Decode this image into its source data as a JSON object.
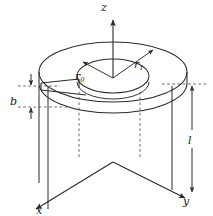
{
  "figure": {
    "background_color": "#ffffff",
    "line_color": "#2b2b2b",
    "dashed_color": "#555555",
    "label_color": "#1a1a1a"
  },
  "axes": {
    "z": {
      "label": "z",
      "direction": "up",
      "arrow": true
    },
    "y": {
      "label": "y",
      "direction": "down-right",
      "arrow": true
    },
    "x": {
      "label": "x",
      "direction": "down-left",
      "arrow": true
    },
    "origin_note": "axes meet at the center of the annulus"
  },
  "dimensions": {
    "r_inner": {
      "symbol": "r",
      "subscript": "0",
      "description": "inner radius of annulus",
      "arrow": "from center to inner edge, up-left"
    },
    "r_outer": {
      "symbol": "r",
      "subscript": "1",
      "description": "outer radius of annulus",
      "arrow": "from center to outer edge, up-right"
    },
    "thickness": {
      "symbol": "b",
      "description": "axial thickness of the disk",
      "arrow": "double arrow between two dashed extension lines, left side"
    },
    "length": {
      "symbol": "l",
      "description": "axial length below the disk",
      "arrow": "double-headed vertical arrow, right side"
    }
  },
  "geometry": {
    "shape": "annulus / washer shown in oblique 3D projection",
    "outer_ellipse": {
      "cx": 113,
      "cy": 72,
      "rx": 74,
      "ry": 30
    },
    "inner_ellipse": {
      "cx": 113,
      "cy": 76,
      "rx": 36,
      "ry": 17
    },
    "slot": "radial cut on the left side of the disk",
    "projection_lines": "vertical dashed lines dropping from disk to the axis plane"
  }
}
